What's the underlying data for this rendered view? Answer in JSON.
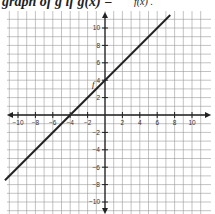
{
  "caption": {
    "left_text": "graph of g if g(x) =",
    "right_text": "f(x) ."
  },
  "function_label": "f",
  "chart_data": {
    "type": "line",
    "title": "",
    "xlabel": "",
    "ylabel": "",
    "xlim": [
      -11.5,
      11.5
    ],
    "ylim": [
      -11.5,
      11.5
    ],
    "grid": true,
    "x_ticks": [
      -10,
      -8,
      -6,
      -4,
      -2,
      2,
      4,
      6,
      8,
      10
    ],
    "y_ticks": [
      10,
      8,
      6,
      4,
      2,
      -2,
      -4,
      -6,
      -8,
      -10
    ],
    "series": [
      {
        "name": "f",
        "equation": "f(x) = x + 4",
        "x": [
          -11.5,
          -4,
          0,
          7.5
        ],
        "y": [
          -7.5,
          0,
          4,
          11.5
        ]
      }
    ],
    "annotations": [
      {
        "text": "f",
        "x": -1.5,
        "y": 3.2
      }
    ]
  },
  "colors": {
    "grid": "#9a9a9a",
    "axis": "#222222",
    "line": "#222222",
    "background": "#ffffff"
  }
}
